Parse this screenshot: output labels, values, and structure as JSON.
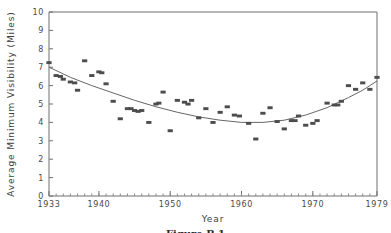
{
  "figure": {
    "caption": "Figure B.1"
  },
  "chart_data": {
    "type": "scatter",
    "title": "",
    "xlabel": "Year",
    "ylabel": "Average Minimum Visibility (Miles)",
    "xlim": [
      1933,
      1979
    ],
    "ylim": [
      0,
      10
    ],
    "grid": false,
    "legend": null,
    "xticks": [
      1933,
      1940,
      1950,
      1960,
      1970,
      1979
    ],
    "xtick_labels": [
      "1933",
      "1940",
      "1950",
      "1960",
      "1970",
      "1979"
    ],
    "yticks": [
      0,
      1,
      2,
      3,
      4,
      5,
      6,
      7,
      8,
      9,
      10
    ],
    "ytick_labels": [
      "0",
      "1",
      "2",
      "3",
      "4",
      "5",
      "6",
      "7",
      "8",
      "9",
      "10"
    ],
    "x_minor_tick_step": 1,
    "marker_style": "small filled rectangle",
    "marker_color": "#4d4d4d",
    "fit_line_color": "#555555",
    "fit_line_type": "quadratic trend curve",
    "series": [
      {
        "name": "Average minimum visibility",
        "points": [
          {
            "x": 1933,
            "y": 7.25
          },
          {
            "x": 1934,
            "y": 6.55
          },
          {
            "x": 1934.6,
            "y": 6.5
          },
          {
            "x": 1935,
            "y": 6.35
          },
          {
            "x": 1936,
            "y": 6.2
          },
          {
            "x": 1936.6,
            "y": 6.15
          },
          {
            "x": 1937,
            "y": 5.75
          },
          {
            "x": 1938,
            "y": 7.35
          },
          {
            "x": 1939,
            "y": 6.55
          },
          {
            "x": 1940,
            "y": 6.75
          },
          {
            "x": 1940.4,
            "y": 6.7
          },
          {
            "x": 1941,
            "y": 6.1
          },
          {
            "x": 1942,
            "y": 5.15
          },
          {
            "x": 1943,
            "y": 4.2
          },
          {
            "x": 1944,
            "y": 4.75
          },
          {
            "x": 1944.5,
            "y": 4.75
          },
          {
            "x": 1945,
            "y": 4.65
          },
          {
            "x": 1945.5,
            "y": 4.6
          },
          {
            "x": 1946,
            "y": 4.65
          },
          {
            "x": 1947,
            "y": 4.0
          },
          {
            "x": 1948,
            "y": 5.0
          },
          {
            "x": 1948.4,
            "y": 5.05
          },
          {
            "x": 1949,
            "y": 5.65
          },
          {
            "x": 1950,
            "y": 3.55
          },
          {
            "x": 1951,
            "y": 5.2
          },
          {
            "x": 1952,
            "y": 5.1
          },
          {
            "x": 1952.5,
            "y": 5.0
          },
          {
            "x": 1953,
            "y": 5.2
          },
          {
            "x": 1954,
            "y": 4.25
          },
          {
            "x": 1955,
            "y": 4.75
          },
          {
            "x": 1956,
            "y": 4.0
          },
          {
            "x": 1957,
            "y": 4.55
          },
          {
            "x": 1958,
            "y": 4.85
          },
          {
            "x": 1959,
            "y": 4.4
          },
          {
            "x": 1959.7,
            "y": 4.35
          },
          {
            "x": 1961,
            "y": 3.95
          },
          {
            "x": 1962,
            "y": 3.1
          },
          {
            "x": 1963,
            "y": 4.5
          },
          {
            "x": 1964,
            "y": 4.8
          },
          {
            "x": 1965,
            "y": 4.05
          },
          {
            "x": 1966,
            "y": 3.65
          },
          {
            "x": 1967,
            "y": 4.1
          },
          {
            "x": 1967.5,
            "y": 4.1
          },
          {
            "x": 1968,
            "y": 4.35
          },
          {
            "x": 1969,
            "y": 3.85
          },
          {
            "x": 1970,
            "y": 3.95
          },
          {
            "x": 1970.6,
            "y": 4.1
          },
          {
            "x": 1972,
            "y": 5.05
          },
          {
            "x": 1973,
            "y": 4.95
          },
          {
            "x": 1973.5,
            "y": 4.95
          },
          {
            "x": 1974,
            "y": 5.15
          },
          {
            "x": 1975,
            "y": 6.0
          },
          {
            "x": 1976,
            "y": 5.8
          },
          {
            "x": 1977,
            "y": 6.15
          },
          {
            "x": 1978,
            "y": 5.8
          },
          {
            "x": 1979,
            "y": 6.45
          }
        ]
      }
    ],
    "fit_curve": [
      {
        "x": 1933,
        "y": 7.0
      },
      {
        "x": 1936,
        "y": 6.45
      },
      {
        "x": 1939,
        "y": 6.0
      },
      {
        "x": 1942,
        "y": 5.6
      },
      {
        "x": 1945,
        "y": 5.2
      },
      {
        "x": 1948,
        "y": 4.85
      },
      {
        "x": 1951,
        "y": 4.55
      },
      {
        "x": 1954,
        "y": 4.3
      },
      {
        "x": 1957,
        "y": 4.12
      },
      {
        "x": 1960,
        "y": 4.0
      },
      {
        "x": 1963,
        "y": 4.0
      },
      {
        "x": 1966,
        "y": 4.12
      },
      {
        "x": 1969,
        "y": 4.4
      },
      {
        "x": 1972,
        "y": 4.8
      },
      {
        "x": 1975,
        "y": 5.35
      },
      {
        "x": 1977,
        "y": 5.75
      },
      {
        "x": 1979,
        "y": 6.25
      }
    ]
  }
}
